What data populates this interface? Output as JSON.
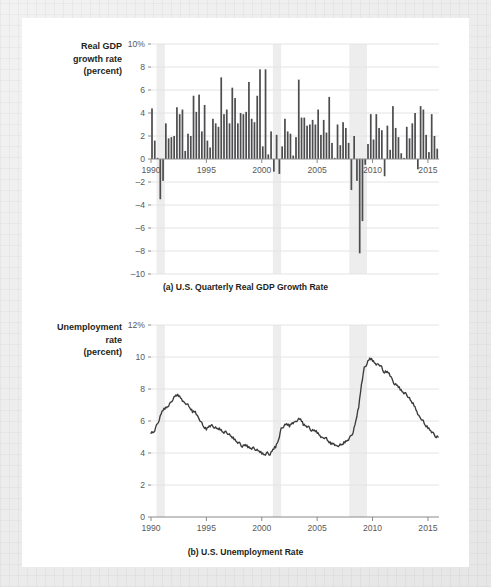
{
  "figure": {
    "panel_a": {
      "axis_label_lines": [
        "Real GDP",
        "growth rate",
        "(percent)"
      ],
      "caption": "(a) U.S. Quarterly Real GDP Growth Rate",
      "y_ticks": [
        "10%",
        "8",
        "6",
        "4",
        "2",
        "0",
        "–2",
        "–4",
        "–6",
        "–8",
        "–10"
      ],
      "x_ticks": [
        "1990",
        "1995",
        "2000",
        "2005",
        "2010",
        "2015"
      ]
    },
    "panel_b": {
      "axis_label_lines": [
        "Unemployment",
        "rate",
        "(percent)"
      ],
      "caption": "(b) U.S. Unemployment Rate",
      "y_ticks": [
        "12%",
        "10",
        "8",
        "6",
        "4",
        "2",
        "0"
      ],
      "x_ticks": [
        "1990",
        "1995",
        "2000",
        "2005",
        "2010",
        "2015"
      ]
    },
    "colors": {
      "bar": "#4d4d4f",
      "line": "#3b3b3d",
      "recession_shade": "#ededed",
      "grid": "#e4e4e4",
      "axis": "#8a8a8a",
      "text": "#231f20"
    }
  },
  "chart_data": [
    {
      "type": "bar",
      "title": "(a) U.S. Quarterly Real GDP Growth Rate",
      "xlabel": "",
      "ylabel": "Real GDP growth rate (percent)",
      "ylim": [
        -10,
        10
      ],
      "xlim": [
        1990.0,
        2016.0
      ],
      "grid": true,
      "legend": "none",
      "x_tick_values": [
        1990,
        1995,
        2000,
        2005,
        2010,
        2015
      ],
      "y_tick_values": [
        -10,
        -8,
        -6,
        -4,
        -2,
        0,
        2,
        4,
        6,
        8,
        10
      ],
      "recession_bands": [
        [
          1990.5,
          1991.25
        ],
        [
          2001.0,
          2001.75
        ],
        [
          2007.9,
          2009.5
        ]
      ],
      "x": [
        1990.0,
        1990.25,
        1990.5,
        1990.75,
        1991.0,
        1991.25,
        1991.5,
        1991.75,
        1992.0,
        1992.25,
        1992.5,
        1992.75,
        1993.0,
        1993.25,
        1993.5,
        1993.75,
        1994.0,
        1994.25,
        1994.5,
        1994.75,
        1995.0,
        1995.25,
        1995.5,
        1995.75,
        1996.0,
        1996.25,
        1996.5,
        1996.75,
        1997.0,
        1997.25,
        1997.5,
        1997.75,
        1998.0,
        1998.25,
        1998.5,
        1998.75,
        1999.0,
        1999.25,
        1999.5,
        1999.75,
        2000.0,
        2000.25,
        2000.5,
        2000.75,
        2001.0,
        2001.25,
        2001.5,
        2001.75,
        2002.0,
        2002.25,
        2002.5,
        2002.75,
        2003.0,
        2003.25,
        2003.5,
        2003.75,
        2004.0,
        2004.25,
        2004.5,
        2004.75,
        2005.0,
        2005.25,
        2005.5,
        2005.75,
        2006.0,
        2006.25,
        2006.5,
        2006.75,
        2007.0,
        2007.25,
        2007.5,
        2007.75,
        2008.0,
        2008.25,
        2008.5,
        2008.75,
        2009.0,
        2009.25,
        2009.5,
        2009.75,
        2010.0,
        2010.25,
        2010.5,
        2010.75,
        2011.0,
        2011.25,
        2011.5,
        2011.75,
        2012.0,
        2012.25,
        2012.5,
        2012.75,
        2013.0,
        2013.25,
        2013.5,
        2013.75,
        2014.0,
        2014.25,
        2014.5,
        2014.75,
        2015.0,
        2015.25,
        2015.5,
        2015.75
      ],
      "values": [
        4.4,
        1.6,
        0.1,
        -3.5,
        -1.9,
        3.1,
        1.8,
        1.9,
        2.0,
        4.5,
        3.9,
        4.3,
        0.7,
        2.2,
        2.0,
        5.5,
        4.1,
        5.6,
        2.4,
        4.7,
        1.6,
        1.0,
        3.5,
        3.1,
        2.8,
        7.1,
        3.9,
        4.3,
        3.1,
        6.2,
        5.3,
        3.1,
        4.0,
        3.9,
        4.1,
        6.7,
        3.5,
        3.2,
        5.5,
        7.8,
        1.1,
        7.8,
        0.4,
        2.4,
        -1.1,
        2.1,
        -1.3,
        1.1,
        3.5,
        2.4,
        2.2,
        0.3,
        1.9,
        6.9,
        3.6,
        3.6,
        2.9,
        3.0,
        3.4,
        3.0,
        4.3,
        2.1,
        3.4,
        2.3,
        5.4,
        1.4,
        0.1,
        3.0,
        1.2,
        3.2,
        2.7,
        1.4,
        -2.7,
        2.0,
        -1.9,
        -8.2,
        -5.4,
        -0.5,
        1.3,
        3.9,
        1.7,
        3.9,
        2.7,
        2.5,
        -1.5,
        2.9,
        0.8,
        4.6,
        2.7,
        1.9,
        0.5,
        0.1,
        2.8,
        1.8,
        3.1,
        4.0,
        -0.9,
        4.6,
        4.3,
        2.1,
        0.6,
        3.9,
        2.0,
        0.9
      ]
    },
    {
      "type": "line",
      "title": "(b) U.S. Unemployment Rate",
      "xlabel": "",
      "ylabel": "Unemployment rate (percent)",
      "ylim": [
        0,
        12
      ],
      "xlim": [
        1990.0,
        2016.0
      ],
      "grid": true,
      "legend": "none",
      "x_tick_values": [
        1990,
        1995,
        2000,
        2005,
        2010,
        2015
      ],
      "y_tick_values": [
        0,
        2,
        4,
        6,
        8,
        10,
        12
      ],
      "recession_bands": [
        [
          1990.5,
          1991.25
        ],
        [
          2001.0,
          2001.75
        ],
        [
          2007.9,
          2009.5
        ]
      ],
      "x": [
        1990.0,
        1990.25,
        1990.5,
        1990.75,
        1991.0,
        1991.25,
        1991.5,
        1991.75,
        1992.0,
        1992.25,
        1992.5,
        1992.75,
        1993.0,
        1993.25,
        1993.5,
        1993.75,
        1994.0,
        1994.25,
        1994.5,
        1994.75,
        1995.0,
        1995.25,
        1995.5,
        1995.75,
        1996.0,
        1996.25,
        1996.5,
        1996.75,
        1997.0,
        1997.25,
        1997.5,
        1997.75,
        1998.0,
        1998.25,
        1998.5,
        1998.75,
        1999.0,
        1999.25,
        1999.5,
        1999.75,
        2000.0,
        2000.25,
        2000.5,
        2000.75,
        2001.0,
        2001.25,
        2001.5,
        2001.75,
        2002.0,
        2002.25,
        2002.5,
        2002.75,
        2003.0,
        2003.25,
        2003.5,
        2003.75,
        2004.0,
        2004.25,
        2004.5,
        2004.75,
        2005.0,
        2005.25,
        2005.5,
        2005.75,
        2006.0,
        2006.25,
        2006.5,
        2006.75,
        2007.0,
        2007.25,
        2007.5,
        2007.75,
        2008.0,
        2008.25,
        2008.5,
        2008.75,
        2009.0,
        2009.25,
        2009.5,
        2009.75,
        2010.0,
        2010.25,
        2010.5,
        2010.75,
        2011.0,
        2011.25,
        2011.5,
        2011.75,
        2012.0,
        2012.25,
        2012.5,
        2012.75,
        2013.0,
        2013.25,
        2013.5,
        2013.75,
        2014.0,
        2014.25,
        2014.5,
        2014.75,
        2015.0,
        2015.25,
        2015.5,
        2015.75
      ],
      "values": [
        5.3,
        5.3,
        5.7,
        6.1,
        6.6,
        6.8,
        6.9,
        7.1,
        7.4,
        7.6,
        7.6,
        7.4,
        7.1,
        7.1,
        6.8,
        6.6,
        6.6,
        6.2,
        6.0,
        5.6,
        5.5,
        5.7,
        5.7,
        5.6,
        5.5,
        5.5,
        5.3,
        5.3,
        5.2,
        5.0,
        4.9,
        4.7,
        4.6,
        4.4,
        4.5,
        4.4,
        4.3,
        4.3,
        4.2,
        4.1,
        4.0,
        3.9,
        4.0,
        3.9,
        4.2,
        4.4,
        4.8,
        5.5,
        5.7,
        5.8,
        5.7,
        5.9,
        5.9,
        6.1,
        6.1,
        5.8,
        5.7,
        5.6,
        5.4,
        5.4,
        5.3,
        5.1,
        4.9,
        5.0,
        4.7,
        4.6,
        4.6,
        4.4,
        4.5,
        4.5,
        4.7,
        4.8,
        5.0,
        5.3,
        6.0,
        6.9,
        8.3,
        9.3,
        9.6,
        9.9,
        9.8,
        9.6,
        9.5,
        9.5,
        9.0,
        9.1,
        9.0,
        8.6,
        8.3,
        8.2,
        8.0,
        7.8,
        7.7,
        7.5,
        7.2,
        7.0,
        6.6,
        6.2,
        6.1,
        5.7,
        5.6,
        5.4,
        5.2,
        5.0
      ]
    }
  ]
}
